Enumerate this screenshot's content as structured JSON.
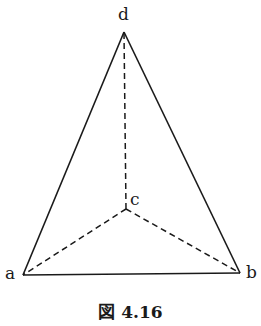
{
  "figure": {
    "caption": "図 4.16",
    "type": "tetrahedron (triangular pyramid) with hidden edges dashed"
  },
  "vertices": {
    "a": {
      "label": "a",
      "x": 23,
      "y": 275
    },
    "b": {
      "label": "b",
      "x": 240,
      "y": 273
    },
    "c": {
      "label": "c",
      "x": 126,
      "y": 209
    },
    "d": {
      "label": "d",
      "x": 124,
      "y": 32
    }
  },
  "edges": [
    {
      "from": "a",
      "to": "b",
      "style": "solid"
    },
    {
      "from": "a",
      "to": "d",
      "style": "solid"
    },
    {
      "from": "b",
      "to": "d",
      "style": "solid"
    },
    {
      "from": "c",
      "to": "d",
      "style": "dashed"
    },
    {
      "from": "c",
      "to": "a",
      "style": "dashed"
    },
    {
      "from": "c",
      "to": "b",
      "style": "dashed"
    }
  ],
  "colors": {
    "stroke": "#1a1a1a",
    "background": "#ffffff"
  }
}
